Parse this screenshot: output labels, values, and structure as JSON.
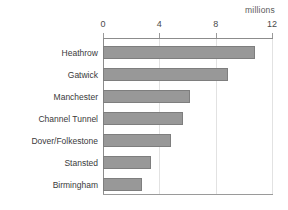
{
  "top_crop_text": "",
  "unit_label": "millions",
  "axis": {
    "ticks": [
      {
        "value": 0,
        "label": "0"
      },
      {
        "value": 4,
        "label": "4"
      },
      {
        "value": 8,
        "label": "8"
      },
      {
        "value": 12,
        "label": "12"
      }
    ]
  },
  "colors": {
    "bar_fill": "#989898",
    "bar_stroke": "#7e7e7e",
    "axis": "#8c8c8c",
    "gridline": "#e2e2e2",
    "text": "#3a3a3a"
  },
  "chart_data": {
    "type": "bar",
    "orientation": "horizontal",
    "title": "",
    "subtitle": "",
    "xlabel": "millions",
    "ylabel": "",
    "xlim": [
      0,
      12
    ],
    "xticks": [
      0,
      4,
      8,
      12
    ],
    "grid": true,
    "legend": false,
    "categories": [
      "Heathrow",
      "Gatwick",
      "Manchester",
      "Channel Tunnel",
      "Dover/Folkestone",
      "Stansted",
      "Birmingham"
    ],
    "values": [
      10.8,
      8.9,
      6.2,
      5.7,
      4.8,
      3.4,
      2.8
    ],
    "unit": "millions"
  }
}
